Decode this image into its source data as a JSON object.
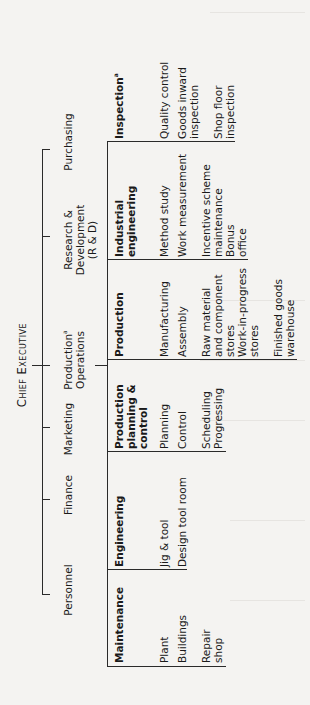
{
  "title": "Chief Executive",
  "departments": [
    {
      "label": "Personnel"
    },
    {
      "label": "Finance"
    },
    {
      "label": "Marketing"
    },
    {
      "label": "Production",
      "sup": "a",
      "label2": "Operations"
    },
    {
      "label": "Research &",
      "label2": "Development",
      "label3": "(R & D)"
    },
    {
      "label": "Purchasing"
    }
  ],
  "groups": [
    {
      "head": "Maintenance",
      "items": [
        "Plant",
        "Buildings",
        "Repair",
        "shop"
      ]
    },
    {
      "head": "Engineering",
      "items": [
        "Jig & tool",
        "Design tool room"
      ]
    },
    {
      "head": "Production",
      "head2": "planning &",
      "head3": "control",
      "items": [
        "Planning",
        "Control",
        "Scheduling",
        "Progressing"
      ]
    },
    {
      "head": "Production",
      "items": [
        "Manufacturing",
        "Assembly",
        "Raw material",
        "and component",
        "stores",
        "Work-in-progress",
        "stores",
        "Finished goods",
        "warehouse"
      ]
    },
    {
      "head": "Industrial",
      "head2": "engineering",
      "items": [
        "Method study",
        "Work measurement",
        "Incentive scheme",
        "maintenance",
        "Bonus",
        "office"
      ]
    },
    {
      "head": "Inspection",
      "sup": "a",
      "items": [
        "Quality control",
        "Goods inward",
        "inspection",
        "Shop floor",
        "inspection"
      ]
    }
  ],
  "colors": {
    "background": "#f4f3f1",
    "line": "#2a2a2a",
    "text": "#1a1a1a"
  }
}
